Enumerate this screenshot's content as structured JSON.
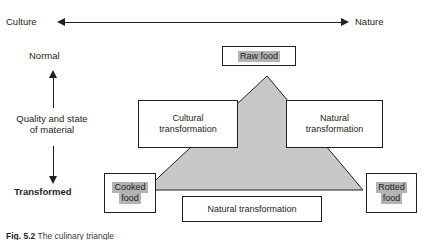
{
  "diagram": {
    "axes": {
      "horizontal": {
        "left_label": "Culture",
        "right_label": "Nature",
        "arrow": "double-headed-horizontal-arrow"
      },
      "vertical": {
        "top_label": "Normal",
        "middle_label_line1": "Quality and state",
        "middle_label_line2": "of material",
        "bottom_label": "Transformed",
        "up_arrow": "up-arrow",
        "down_arrow": "down-arrow"
      }
    },
    "nodes": {
      "raw_food": "Raw food",
      "cultural_transformation_line1": "Cultural",
      "cultural_transformation_line2": "transformation",
      "natural_transformation_right_line1": "Natural",
      "natural_transformation_right_line2": "transformation",
      "cooked_food_line1": "Cooked",
      "cooked_food_line2": "food",
      "rotted_food_line1": "Rotted",
      "rotted_food_line2": "food",
      "natural_transformation_bottom": "Natural transformation"
    },
    "shape": {
      "name": "culinary-triangle",
      "fill_color": "#c8c8c8",
      "stroke_color": "#231f20"
    },
    "colors": {
      "ink": "#231f20",
      "highlight": "#b3b3b3",
      "triangle_fill": "#c8c8c8",
      "background": "#ffffff"
    }
  },
  "caption": {
    "figure_number": "Fig. 5.2",
    "text": "The culinary triangle"
  }
}
